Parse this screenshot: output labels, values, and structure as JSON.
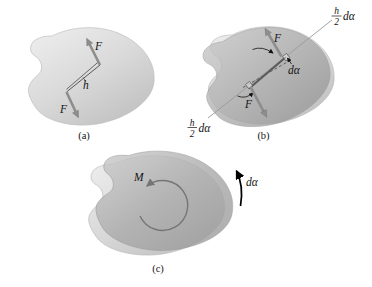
{
  "figure": {
    "panel_a": {
      "caption": "(a)",
      "force_top": "F",
      "force_bottom": "F",
      "distance": "h"
    },
    "panel_b": {
      "caption": "(b)",
      "force_top": "F",
      "force_bottom": "F",
      "angle": "dα",
      "disp_top": {
        "num": "h",
        "den": "2",
        "suffix": "dα"
      },
      "disp_bottom": {
        "num": "h",
        "den": "2",
        "suffix": "dα"
      }
    },
    "panel_c": {
      "caption": "(c)",
      "moment": "M",
      "angle": "dα"
    },
    "colors": {
      "body_light": "#d9d9d9",
      "body_dark": "#a6a6a6",
      "arrow": "#8d8d8d",
      "leader": "#9a9a9a",
      "ink": "#141414"
    }
  }
}
